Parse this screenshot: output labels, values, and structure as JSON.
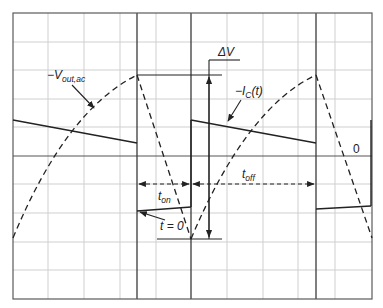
{
  "diagram": {
    "labels": {
      "vout_prefix": "−V",
      "vout_sub": "out,ac",
      "ic_prefix": "−I",
      "ic_sub": "C",
      "ic_suffix": "(t)",
      "delta_v": "ΔV",
      "t_on_main": "t",
      "t_on_sub": "on",
      "t_off_main": "t",
      "t_off_sub": "off",
      "t_zero": "t = 0",
      "zero": "0"
    },
    "colors": {
      "line": "#222222",
      "grid_minor": "#cfcfcf",
      "grid_major": "#3a3a3a",
      "background": "#ffffff"
    },
    "grid": {
      "x_lines": [
        13,
        48,
        84,
        120,
        156,
        227,
        263,
        298,
        335,
        372
      ],
      "y_lines": [
        13,
        42,
        70,
        99,
        127,
        184,
        213,
        242,
        270,
        299
      ],
      "major_x": [
        137,
        191,
        316
      ],
      "center_y": 156
    },
    "waveforms": {
      "capacitor_current_solid": [
        [
          [
            13,
            120
          ],
          [
            137,
            143
          ]
        ],
        [
          [
            137,
            211
          ],
          [
            191,
            207
          ]
        ],
        [
          [
            191,
            120
          ],
          [
            316,
            143
          ]
        ],
        [
          [
            316,
            209
          ],
          [
            371,
            206
          ]
        ],
        [
          [
            371,
            206
          ],
          [
            371,
            120
          ]
        ]
      ],
      "output_voltage_dashed_peak_points": [
        [
          13,
          238
        ],
        [
          137,
          75
        ],
        [
          191,
          239
        ],
        [
          316,
          75
        ],
        [
          372,
          238
        ]
      ]
    }
  }
}
